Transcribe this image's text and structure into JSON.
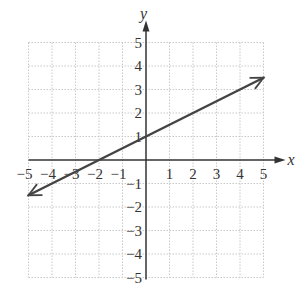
{
  "chart_data": {
    "type": "line",
    "title": "",
    "xlabel": "x",
    "ylabel": "y",
    "xlim": [
      -5,
      5
    ],
    "ylim": [
      -5,
      5
    ],
    "grid": true,
    "x_ticks": [
      "-5",
      "-4",
      "-3",
      "-2",
      "-1",
      "1",
      "2",
      "3",
      "4",
      "5"
    ],
    "y_ticks": [
      "5",
      "4",
      "3",
      "2",
      "1",
      "-1",
      "-2",
      "-3",
      "-4",
      "-5"
    ],
    "series": [
      {
        "name": "line",
        "equation": "y = 0.5x + 1",
        "slope": 0.5,
        "y_intercept": 1,
        "x_intercept": -2,
        "x": [
          -5,
          -2,
          0,
          5
        ],
        "y": [
          -1.5,
          0,
          1,
          3.5
        ],
        "arrows": "both",
        "color": "#444444"
      }
    ]
  },
  "colors": {
    "grid": "#c8c8c8",
    "axis": "#333333",
    "line": "#444444"
  }
}
